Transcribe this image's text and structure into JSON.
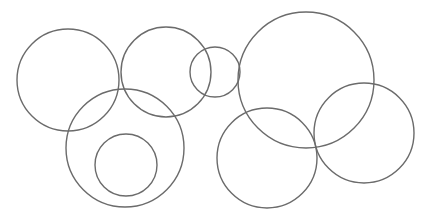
{
  "figure": {
    "width": 426,
    "height": 224,
    "background_color": "#ffffff",
    "stroke_color": "#6b6b6b",
    "stroke_width": 1.4,
    "fill": "none"
  },
  "chart_data": {
    "type": "scatter",
    "title": "",
    "xlabel": "",
    "ylabel": "",
    "grid": false,
    "legend": null,
    "xlim": [
      0,
      426
    ],
    "ylim": [
      0,
      224
    ],
    "shape": "circle-outline",
    "count": 8,
    "series": [
      {
        "name": "circles",
        "values": [
          {
            "id": "circle-left-top",
            "cx": 68,
            "cy": 80,
            "r": 51
          },
          {
            "id": "circle-mid-top",
            "cx": 166,
            "cy": 72,
            "r": 45
          },
          {
            "id": "circle-small-center",
            "cx": 215,
            "cy": 72,
            "r": 25
          },
          {
            "id": "circle-large-right-top",
            "cx": 306,
            "cy": 80,
            "r": 68
          },
          {
            "id": "circle-bottom-left-outer",
            "cx": 125,
            "cy": 148,
            "r": 59
          },
          {
            "id": "circle-bottom-left-inner",
            "cx": 126,
            "cy": 165,
            "r": 31
          },
          {
            "id": "circle-bottom-middle",
            "cx": 267,
            "cy": 158,
            "r": 50
          },
          {
            "id": "circle-bottom-right",
            "cx": 364,
            "cy": 133,
            "r": 50
          }
        ]
      }
    ]
  }
}
